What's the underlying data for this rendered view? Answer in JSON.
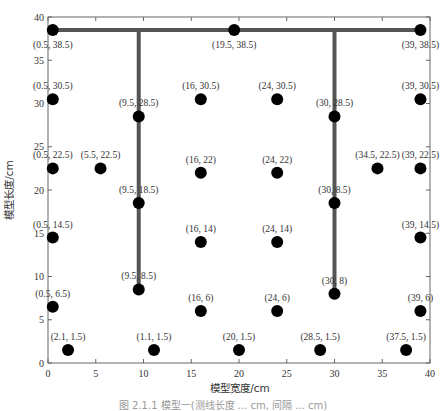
{
  "chart_data": {
    "type": "scatter",
    "title": "",
    "xlabel": "模型宽度/cm",
    "ylabel": "模型长度/cm",
    "xlim": [
      0,
      40
    ],
    "ylim": [
      0,
      40
    ],
    "xticks": [
      0,
      5,
      10,
      15,
      20,
      25,
      30,
      35,
      40
    ],
    "yticks": [
      0,
      5,
      10,
      15,
      20,
      25,
      30,
      35,
      40
    ],
    "grid": false,
    "legend": null,
    "points": [
      {
        "x": 0.5,
        "y": 38.5,
        "label": "(0.5, 38.5)"
      },
      {
        "x": 19.5,
        "y": 38.5,
        "label": "(19.5, 38.5)"
      },
      {
        "x": 39,
        "y": 38.5,
        "label": "(39, 38.5)"
      },
      {
        "x": 0.5,
        "y": 30.5,
        "label": "(0.5, 30.5)"
      },
      {
        "x": 9.5,
        "y": 28.5,
        "label": "(9.5, 28.5)"
      },
      {
        "x": 16,
        "y": 30.5,
        "label": "(16, 30.5)"
      },
      {
        "x": 24,
        "y": 30.5,
        "label": "(24, 30.5)"
      },
      {
        "x": 30,
        "y": 28.5,
        "label": "(30, 28.5)"
      },
      {
        "x": 39,
        "y": 30.5,
        "label": "(39, 30.5)"
      },
      {
        "x": 0.5,
        "y": 22.5,
        "label": "(0.5, 22.5)"
      },
      {
        "x": 5.5,
        "y": 22.5,
        "label": "(5.5, 22.5)"
      },
      {
        "x": 16,
        "y": 22,
        "label": "(16, 22)"
      },
      {
        "x": 24,
        "y": 22,
        "label": "(24, 22)"
      },
      {
        "x": 34.5,
        "y": 22.5,
        "label": "(34.5, 22.5)"
      },
      {
        "x": 39,
        "y": 22.5,
        "label": "(39, 22.5)"
      },
      {
        "x": 9.5,
        "y": 18.5,
        "label": "(9.5, 18.5)"
      },
      {
        "x": 30,
        "y": 18.5,
        "label": "(30, 8.5)"
      },
      {
        "x": 0.5,
        "y": 14.5,
        "label": "(0.5, 14.5)"
      },
      {
        "x": 16,
        "y": 14,
        "label": "(16, 14)"
      },
      {
        "x": 24,
        "y": 14,
        "label": "(24, 14)"
      },
      {
        "x": 39,
        "y": 14.5,
        "label": "(39, 14.5)"
      },
      {
        "x": 9.5,
        "y": 8.5,
        "label": "(9.5, 8.5)"
      },
      {
        "x": 30,
        "y": 8,
        "label": "(30, 8)"
      },
      {
        "x": 0.5,
        "y": 6.5,
        "label": "(0.5, 6.5)"
      },
      {
        "x": 16,
        "y": 6,
        "label": "(16, 6)"
      },
      {
        "x": 24,
        "y": 6,
        "label": "(24, 6)"
      },
      {
        "x": 39,
        "y": 6,
        "label": "(39, 6)"
      },
      {
        "x": 2.1,
        "y": 1.5,
        "label": "(2.1, 1.5)"
      },
      {
        "x": 11.1,
        "y": 1.5,
        "label": "(1.1, 1.5)"
      },
      {
        "x": 20,
        "y": 1.5,
        "label": "(20, 1.5)"
      },
      {
        "x": 28.5,
        "y": 1.5,
        "label": "(28.5, 1.5)"
      },
      {
        "x": 37.5,
        "y": 1.5,
        "label": "(37.5, 1.5)"
      }
    ],
    "lines": [
      {
        "name": "top-horizontal",
        "x": [
          0.5,
          39
        ],
        "y": [
          38.5,
          38.5
        ]
      },
      {
        "name": "left-vertical",
        "x": [
          9.5,
          9.5
        ],
        "y": [
          38.5,
          8.5
        ]
      },
      {
        "name": "right-vertical",
        "x": [
          30,
          30
        ],
        "y": [
          38.5,
          8
        ]
      }
    ],
    "colors": {
      "points": "#000000",
      "lines": "#555555",
      "frame": "#666666"
    }
  },
  "caption": "图 2.1.1   模型一(测线长度 ... cm, 间隔 ... cm)"
}
